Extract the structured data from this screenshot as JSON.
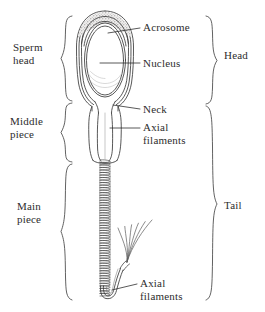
{
  "figure": {
    "background_color": "#ffffff",
    "ink_color": "#3a3a3a",
    "stipple_color": "#8d8d8d"
  },
  "region_labels_left": [
    {
      "id": "sperm-head",
      "line1": "Sperm",
      "line2": "head",
      "brace_top": 16,
      "brace_bottom": 101
    },
    {
      "id": "middle-piece",
      "line1": "Middle",
      "line2": "piece",
      "brace_top": 103,
      "brace_bottom": 162
    },
    {
      "id": "main-piece",
      "line1": "Main",
      "line2": "piece",
      "brace_top": 164,
      "brace_bottom": 300
    }
  ],
  "region_labels_right": [
    {
      "id": "head",
      "text": "Head",
      "brace_top": 16,
      "brace_bottom": 104
    },
    {
      "id": "tail",
      "text": "Tail",
      "brace_top": 106,
      "brace_bottom": 300
    }
  ],
  "part_labels": [
    {
      "id": "acrosome",
      "line1": "Acrosome",
      "line2": ""
    },
    {
      "id": "nucleus",
      "line1": "Nucleus",
      "line2": ""
    },
    {
      "id": "neck",
      "line1": "Neck",
      "line2": ""
    },
    {
      "id": "axial-filaments-upper",
      "line1": "Axial",
      "line2": "filaments"
    },
    {
      "id": "axial-filaments-lower",
      "line1": "Axial",
      "line2": "filaments"
    }
  ],
  "anatomy": {
    "head_outer_ellipse": {
      "cx": 105,
      "cy": 57,
      "rx": 28,
      "ry": 45
    },
    "head_inner_ellipse": {
      "cx": 105,
      "cy": 59,
      "rx": 22,
      "ry": 38
    },
    "nucleus_ellipse": {
      "cx": 105,
      "cy": 62,
      "rx": 18,
      "ry": 33
    },
    "acrosome_cap": {
      "cx": 105,
      "cy": 33,
      "rx": 24,
      "ry": 19
    },
    "neck_y": 108,
    "middle_piece_top": 104,
    "middle_piece_bottom": 162,
    "tail_coil_top": 160,
    "tail_coil_bottom": 296,
    "tail_coil_center_x": 105,
    "tail_coil_half_width": 5,
    "tail_coil_turns": 54,
    "filament_count": 6
  }
}
